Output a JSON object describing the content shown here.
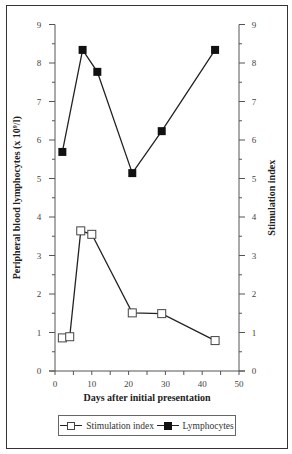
{
  "chart_data": {
    "type": "line",
    "title": "",
    "xlabel": "Days after initial presentation",
    "ylabel_left": "Peripheral blood lymphocytes (x 10⁹/l)",
    "ylabel_right": "Stimulation index",
    "xlim": [
      0,
      50
    ],
    "ylim_left": [
      0,
      9
    ],
    "ylim_right": [
      0,
      9
    ],
    "x_ticks": [
      0,
      10,
      20,
      30,
      40,
      50
    ],
    "y_ticks": [
      0,
      1,
      2,
      3,
      4,
      5,
      6,
      7,
      8,
      9
    ],
    "grid": false,
    "legend_position": "bottom",
    "series": [
      {
        "name": "Stimulation index",
        "marker": "open-square",
        "axis": "right",
        "x": [
          2,
          4,
          7,
          10,
          21,
          29,
          43.5
        ],
        "values": [
          0.86,
          0.89,
          3.64,
          3.55,
          1.51,
          1.49,
          0.79
        ]
      },
      {
        "name": "Lymphocytes",
        "marker": "filled-square",
        "axis": "left",
        "x": [
          2,
          7.5,
          11.5,
          21,
          29,
          43.5
        ],
        "values": [
          5.69,
          8.34,
          7.77,
          5.14,
          6.23,
          8.34
        ]
      }
    ]
  },
  "legend": {
    "items": [
      {
        "label": "Stimulation index"
      },
      {
        "label": "Lymphocytes"
      }
    ]
  },
  "axes": {
    "x_title": "Days after initial presentation",
    "y_left_title": "Peripheral blood lymphocytes (x 10⁹/l)",
    "y_right_title": "Stimulation index"
  }
}
